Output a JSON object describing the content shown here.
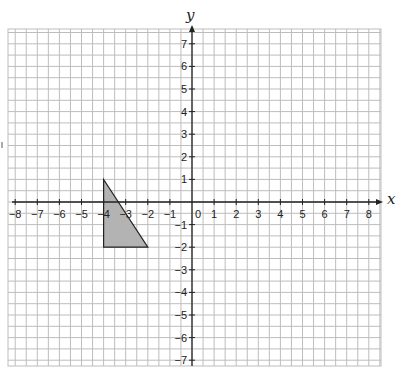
{
  "chart_data": {
    "type": "scatter",
    "title": "",
    "xlabel": "x",
    "ylabel": "y",
    "xlim": [
      -8,
      8
    ],
    "ylim": [
      -7,
      7
    ],
    "grid": true,
    "grid_step": 0.5,
    "x_ticks": [
      -8,
      -7,
      -6,
      -5,
      -4,
      -3,
      -2,
      -1,
      0,
      1,
      2,
      3,
      4,
      5,
      6,
      7,
      8
    ],
    "x_tick_labels": [
      "−8",
      "−7",
      "−6",
      "−5",
      "−4",
      "−3",
      "−2",
      "−1",
      "0",
      "1",
      "2",
      "3",
      "4",
      "5",
      "6",
      "7",
      "8"
    ],
    "y_ticks": [
      -7,
      -6,
      -5,
      -4,
      -3,
      -2,
      -1,
      1,
      2,
      3,
      4,
      5,
      6,
      7
    ],
    "y_tick_labels": [
      "−7",
      "−6",
      "−5",
      "−4",
      "−3",
      "−2",
      "−1",
      "1",
      "2",
      "3",
      "4",
      "5",
      "6",
      "7"
    ],
    "shapes": [
      {
        "name": "triangle",
        "type": "polygon",
        "vertices": [
          [
            -4,
            1
          ],
          [
            -4,
            -2
          ],
          [
            -2,
            -2
          ]
        ],
        "fill": "#b3b3b3",
        "stroke": "#222222"
      }
    ]
  },
  "colors": {
    "grid": "#bdbdbd",
    "axis": "#222222",
    "shape_fill": "#b3b3b3"
  }
}
